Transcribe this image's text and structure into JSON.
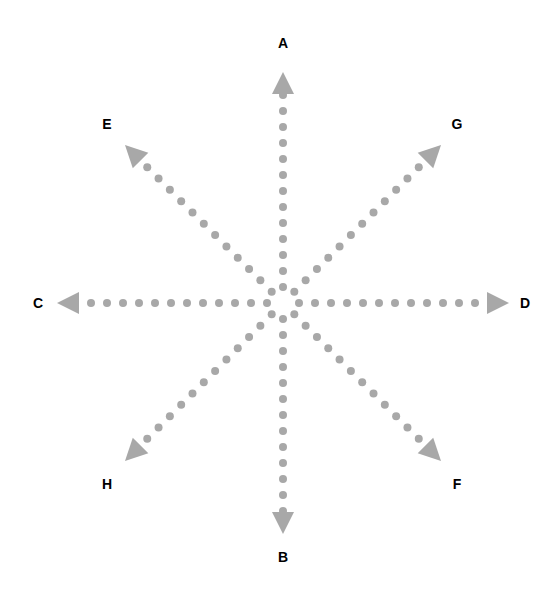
{
  "figure": {
    "title": "",
    "background_color": "#ffffff",
    "ray_color": "#a8a8a8",
    "label_color": "#000000",
    "center": {
      "x": 283,
      "y": 303
    },
    "dot_radius": 4,
    "dot_spacing": 16,
    "arrow_length": 22,
    "arrow_half_width": 11
  },
  "rays": [
    {
      "id": "ray-a",
      "label": "A",
      "direction": "up",
      "angle_deg": 270,
      "label_x": 283,
      "label_y": 43,
      "tip_x": 283,
      "tip_y": 72,
      "dot_count": 13
    },
    {
      "id": "ray-g",
      "label": "G",
      "direction": "up-right",
      "angle_deg": 315,
      "label_x": 457,
      "label_y": 124,
      "tip_x": 441,
      "tip_y": 145,
      "dot_count": 12
    },
    {
      "id": "ray-d",
      "label": "D",
      "direction": "right",
      "angle_deg": 0,
      "label_x": 525,
      "label_y": 303,
      "tip_x": 509,
      "tip_y": 303,
      "dot_count": 13
    },
    {
      "id": "ray-f",
      "label": "F",
      "direction": "down-right",
      "angle_deg": 45,
      "label_x": 457,
      "label_y": 484,
      "tip_x": 441,
      "tip_y": 461,
      "dot_count": 12
    },
    {
      "id": "ray-b",
      "label": "B",
      "direction": "down",
      "angle_deg": 90,
      "label_x": 283,
      "label_y": 557,
      "tip_x": 283,
      "tip_y": 534,
      "dot_count": 13
    },
    {
      "id": "ray-h",
      "label": "H",
      "direction": "down-left",
      "angle_deg": 135,
      "label_x": 107,
      "label_y": 484,
      "tip_x": 125,
      "tip_y": 461,
      "dot_count": 12
    },
    {
      "id": "ray-c",
      "label": "C",
      "direction": "left",
      "angle_deg": 180,
      "label_x": 38,
      "label_y": 303,
      "tip_x": 57,
      "tip_y": 303,
      "dot_count": 13
    },
    {
      "id": "ray-e",
      "label": "E",
      "direction": "up-left",
      "angle_deg": 225,
      "label_x": 107,
      "label_y": 124,
      "tip_x": 125,
      "tip_y": 145,
      "dot_count": 12
    }
  ]
}
